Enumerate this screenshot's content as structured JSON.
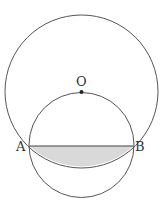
{
  "diagram": {
    "labels": {
      "center": "O",
      "left_point": "A",
      "right_point": "B"
    },
    "colors": {
      "stroke": "#555555",
      "shade": "#d9d9d9",
      "background": "#ffffff"
    }
  }
}
